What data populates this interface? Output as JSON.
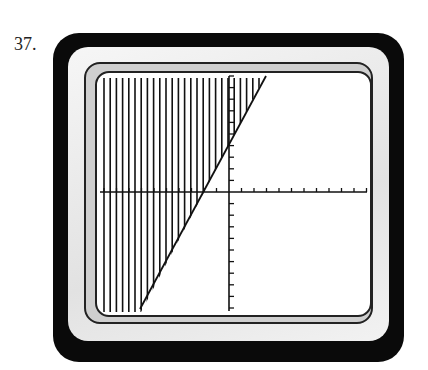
{
  "problem_number": "37.",
  "diagram": {
    "type": "graphing-calculator-screen",
    "line": {
      "x1": 140,
      "y1": 309,
      "x2": 266,
      "y2": 76
    },
    "axes": {
      "x_axis_y": 192,
      "y_axis_x": 229
    },
    "shading": "vertical-lines-left-of-line",
    "colors": {
      "frame": "#0a0a0a",
      "line": "#111111",
      "screen": "#ffffff"
    }
  }
}
